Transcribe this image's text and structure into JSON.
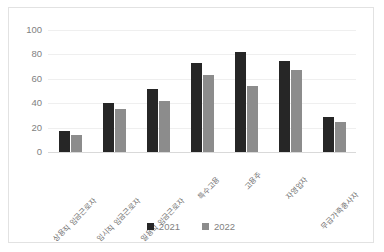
{
  "chart_data": {
    "type": "bar",
    "title": "",
    "subtitle": "",
    "xlabel": "",
    "ylabel": "",
    "ylim": [
      0,
      100
    ],
    "yticks": [
      0,
      20,
      40,
      60,
      80,
      100
    ],
    "grid": true,
    "legend_position": "bottom-center",
    "categories": [
      "상용직 임금근로자",
      "임시직 임금근로자",
      "일용직 임금근로자",
      "특수고용",
      "고용주",
      "자영업자",
      "무급가족종사자"
    ],
    "series": [
      {
        "name": "2021",
        "color": "#262626",
        "values": [
          17,
          40,
          52,
          73,
          82,
          75,
          29
        ]
      },
      {
        "name": "2022",
        "color": "#8c8c8c",
        "values": [
          14,
          35,
          42,
          63,
          54,
          67,
          25
        ]
      }
    ]
  },
  "axis": {
    "tick_100": "100",
    "tick_80": "80",
    "tick_60": "60",
    "tick_40": "40",
    "tick_20": "20",
    "tick_0": "0"
  },
  "legend": {
    "item_0": "2021",
    "item_1": "2022"
  },
  "colors": {
    "series_2021": "#262626",
    "series_2022": "#8c8c8c",
    "gridline": "#efefef",
    "frame_border": "#e2e2e2",
    "tick_text": "#7f7f7f"
  }
}
